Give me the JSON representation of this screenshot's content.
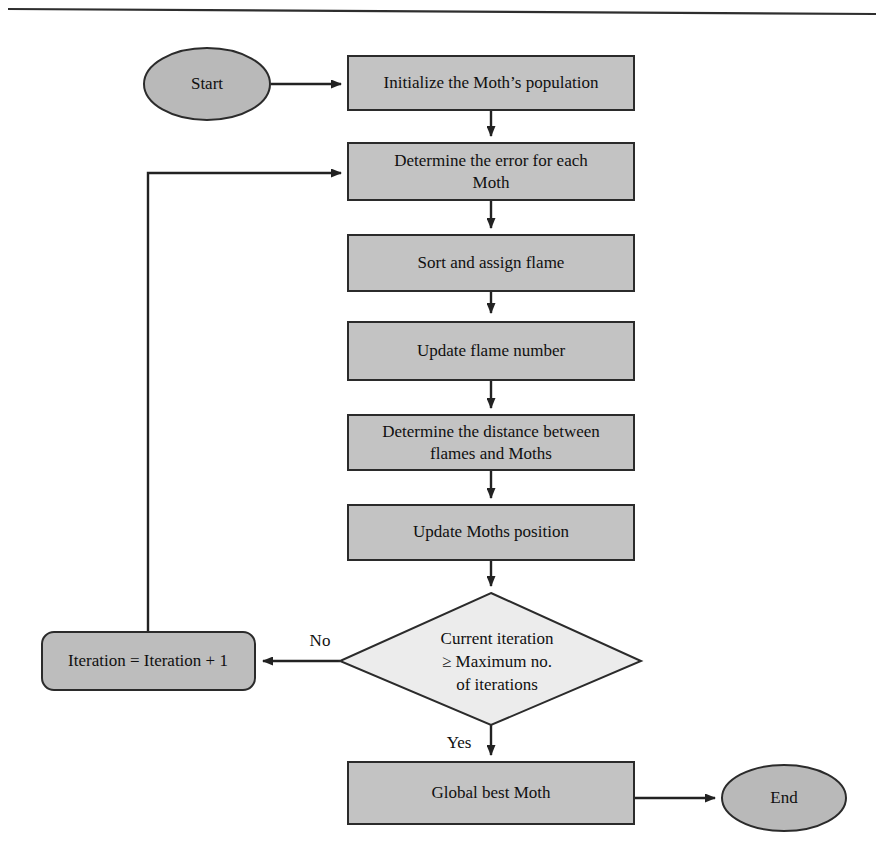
{
  "page": {
    "background_color": "#ffffff",
    "top_rule": true
  },
  "palette": {
    "process_fill": "#c3c3c3",
    "decision_fill": "#ececec",
    "terminator_fill": "#b9b9b9",
    "outline": "#2b2b2b",
    "connector": "#222222",
    "text": "#101010"
  },
  "nodes": {
    "start": {
      "label": "Start",
      "shape": "ellipse"
    },
    "initialize": {
      "label": "Initialize the Moth’s population",
      "shape": "rectangle"
    },
    "determine_error": {
      "line1": "Determine the error for each",
      "line2": "Moth",
      "shape": "rectangle"
    },
    "sort_assign": {
      "label": "Sort and assign flame",
      "shape": "rectangle"
    },
    "update_flame_number": {
      "label": "Update flame number",
      "shape": "rectangle"
    },
    "determine_distance": {
      "line1": "Determine the distance between",
      "line2": "flames and Moths",
      "shape": "rectangle"
    },
    "update_position": {
      "label": "Update Moths position",
      "shape": "rectangle"
    },
    "decision": {
      "line1": "Current iteration",
      "line2": "≥ Maximum no.",
      "line3": "of iterations",
      "shape": "diamond"
    },
    "iteration_increment": {
      "label": "Iteration = Iteration + 1",
      "shape": "rounded-rectangle"
    },
    "global_best": {
      "label": "Global best Moth",
      "shape": "rectangle"
    },
    "end": {
      "label": "End",
      "shape": "ellipse"
    }
  },
  "edge_labels": {
    "no": "No",
    "yes": "Yes"
  }
}
